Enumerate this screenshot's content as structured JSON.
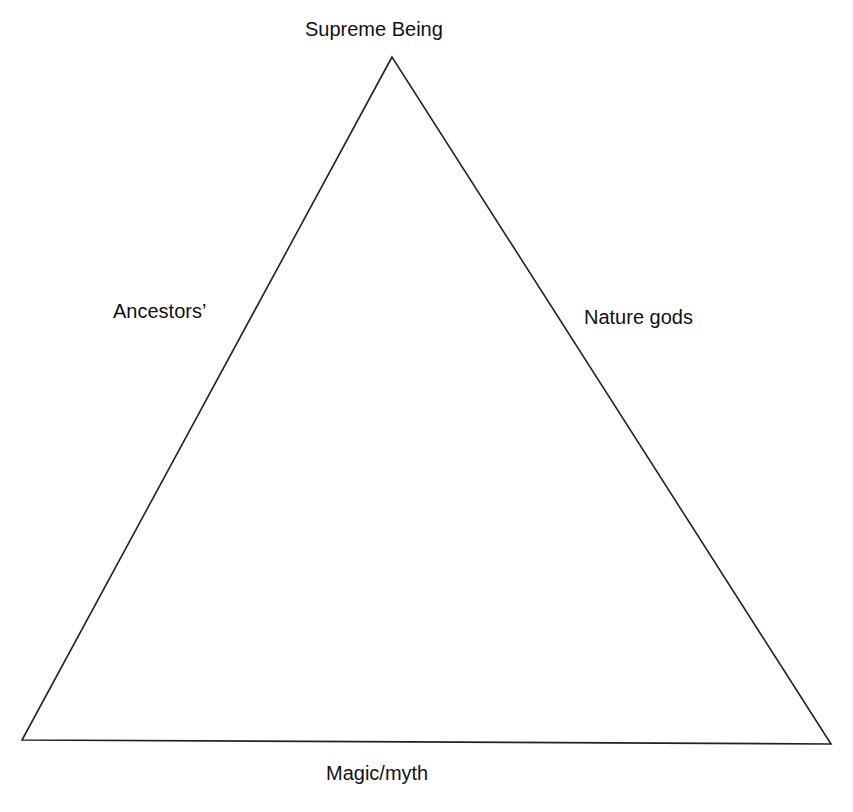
{
  "diagram": {
    "type": "triangle",
    "vertices": {
      "apex": [
        392,
        57
      ],
      "bottom_left": [
        22,
        740
      ],
      "bottom_right": [
        831,
        744
      ]
    },
    "stroke_color": "#222222",
    "labels": {
      "top": "Supreme Being",
      "left": "Ancestors’",
      "right": "Nature gods",
      "bottom": "Magic/myth"
    }
  }
}
